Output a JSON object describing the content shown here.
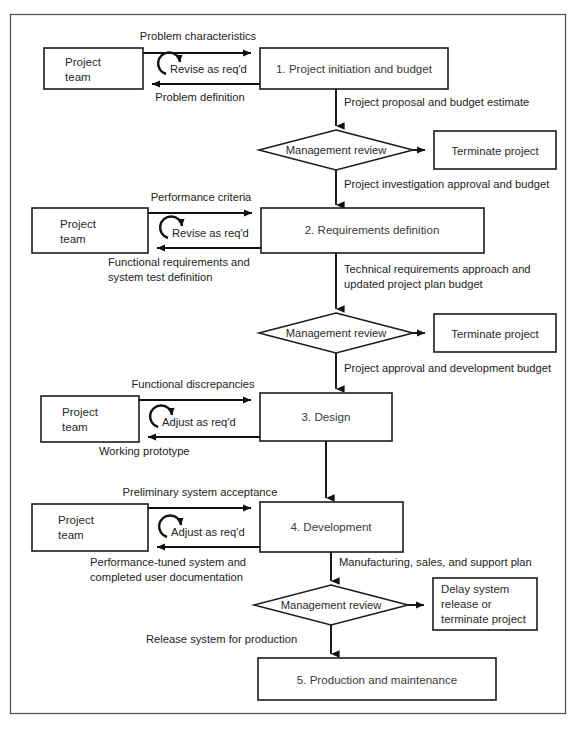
{
  "figure": {
    "kind": "process-flow-diagram",
    "frame_border_color": "#5a5a5a",
    "line_color": "#111111",
    "box_fill": "#ffffff"
  },
  "stages": [
    {
      "id": "stage1",
      "label": "1. Project initiation and budget"
    },
    {
      "id": "stage2",
      "label": "2. Requirements definition"
    },
    {
      "id": "stage3",
      "label": "3. Design"
    },
    {
      "id": "stage4",
      "label": "4. Development"
    },
    {
      "id": "stage5",
      "label": "5. Production and maintenance"
    }
  ],
  "teams": [
    {
      "id": "team1",
      "line1": "Project",
      "line2": "team"
    },
    {
      "id": "team2",
      "line1": "Project",
      "line2": "team"
    },
    {
      "id": "team3",
      "line1": "Project",
      "line2": "team"
    },
    {
      "id": "team4",
      "line1": "Project",
      "line2": "team"
    }
  ],
  "decisions": [
    {
      "id": "review1",
      "label": "Management review"
    },
    {
      "id": "review2",
      "label": "Management review"
    },
    {
      "id": "review3",
      "label": "Management review"
    }
  ],
  "terminals": [
    {
      "id": "terminate1",
      "label": "Terminate project"
    },
    {
      "id": "terminate2",
      "label": "Terminate project"
    },
    {
      "id": "delay3",
      "line1": "Delay system",
      "line2": "release or",
      "line3": "terminate project"
    }
  ],
  "loops": [
    {
      "id": "loop1",
      "label": "Revise as req'd"
    },
    {
      "id": "loop2",
      "label": "Revise as req'd"
    },
    {
      "id": "loop3",
      "label": "Adjust as req'd"
    },
    {
      "id": "loop4",
      "label": "Adjust as req'd"
    }
  ],
  "edge_labels": {
    "in1": "Problem characteristics",
    "out1": "Problem definition",
    "stage1_to_review1": "Project proposal and budget estimate",
    "review1_to_stage2": "Project investigation approval and budget",
    "in2": "Performance criteria",
    "out2_line1": "Functional requirements and",
    "out2_line2": "system test definition",
    "stage2_to_review2_line1": "Technical requirements approach and",
    "stage2_to_review2_line2": "updated project plan budget",
    "review2_to_stage3": "Project approval and development budget",
    "in3": "Functional discrepancies",
    "out3": "Working prototype",
    "in4": "Preliminary system acceptance",
    "out4_line1": "Performance-tuned system and",
    "out4_line2": "completed user documentation",
    "stage4_to_review3": "Manufacturing, sales, and support plan",
    "review3_to_stage5": "Release system for production"
  }
}
